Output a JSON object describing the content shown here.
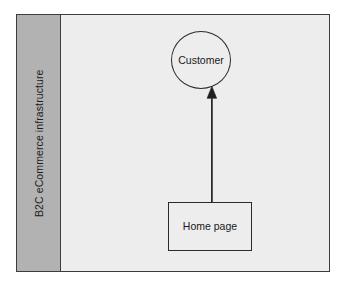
{
  "diagram": {
    "kind": "uml-use-case-diagram",
    "background_color": "#ffffff",
    "frame": {
      "name": "system-boundary",
      "border_color": "#3d3d3d",
      "fill_color": "#ededed"
    },
    "partition": {
      "label": "B2C eCommerce infrastructure",
      "fill_color": "#b2b2b2",
      "text_color": "#1d1d1d",
      "orientation": "vertical-rotated-90"
    },
    "nodes": [
      {
        "id": "customer",
        "shape": "ellipse",
        "label": "Customer",
        "fill_color": "#ededed",
        "border_color": "#2b2b2b"
      },
      {
        "id": "home-page",
        "shape": "rectangle",
        "label": "Home page",
        "fill_color": "#ededed",
        "border_color": "#2b2b2b"
      }
    ],
    "connectors": [
      {
        "id": "home-page-to-customer",
        "from": "home-page",
        "to": "customer",
        "label": "",
        "style": "solid",
        "arrowhead": "filled-triangle",
        "color": "#2b2b2b"
      }
    ]
  }
}
